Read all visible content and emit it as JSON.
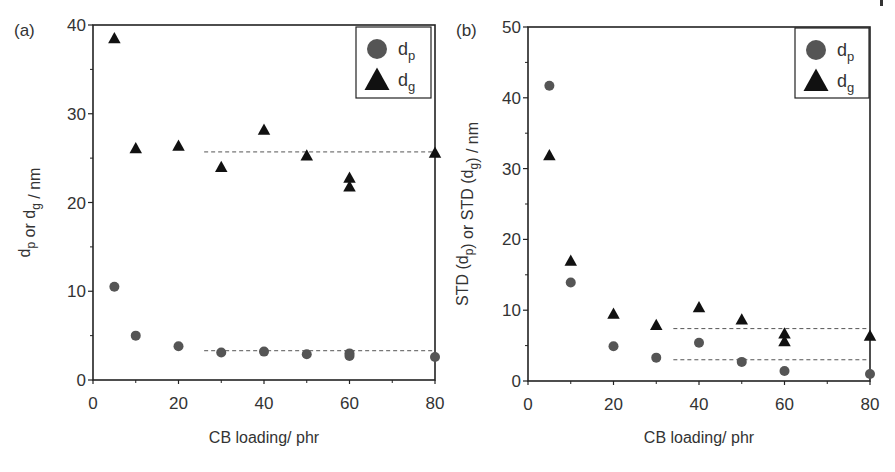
{
  "figure": {
    "corner_mark": "|"
  },
  "chart_data": [
    {
      "panel_label": "(a)",
      "type": "scatter",
      "title": "",
      "xlabel": "CB loading/ phr",
      "ylabel": "d_p or d_g / nm",
      "ylabel_parts": [
        {
          "t": "d",
          "sub": "p"
        },
        {
          "t": " or d",
          "sub": "g"
        },
        {
          "t": " / nm",
          "sub": ""
        }
      ],
      "xlim": [
        0,
        80
      ],
      "ylim": [
        0,
        40
      ],
      "xticks": [
        0,
        20,
        40,
        60,
        80
      ],
      "xminor": [
        10,
        30,
        50,
        70
      ],
      "yticks": [
        0,
        10,
        20,
        30,
        40
      ],
      "yminor": [
        5,
        15,
        25,
        35
      ],
      "grid": false,
      "legend_position": "upper right",
      "legend": [
        {
          "marker": "circle",
          "label": "d",
          "sub": "p",
          "color": "#555555"
        },
        {
          "marker": "triangle",
          "label": "d",
          "sub": "g",
          "color": "#111111"
        }
      ],
      "series": [
        {
          "name": "d_p",
          "marker": "circle",
          "color": "#555555",
          "points": [
            [
              5,
              10.5
            ],
            [
              10,
              5.0
            ],
            [
              20,
              3.8
            ],
            [
              30,
              3.1
            ],
            [
              40,
              3.2
            ],
            [
              50,
              2.9
            ],
            [
              60,
              3.0
            ],
            [
              60,
              2.7
            ],
            [
              80,
              2.6
            ]
          ]
        },
        {
          "name": "d_g",
          "marker": "triangle",
          "color": "#111111",
          "points": [
            [
              5,
              38.5
            ],
            [
              10,
              26.1
            ],
            [
              20,
              26.4
            ],
            [
              30,
              24.0
            ],
            [
              40,
              28.2
            ],
            [
              50,
              25.3
            ],
            [
              60,
              22.8
            ],
            [
              60,
              21.8
            ],
            [
              80,
              25.6
            ]
          ]
        }
      ],
      "reference_lines": [
        {
          "series": "d_g",
          "y": 25.7,
          "x_from": 26,
          "x_to": 80,
          "style": "dashed"
        },
        {
          "series": "d_p",
          "y": 3.3,
          "x_from": 26,
          "x_to": 80,
          "style": "dashed"
        }
      ]
    },
    {
      "panel_label": "(b)",
      "type": "scatter",
      "title": "",
      "xlabel": "CB loading/ phr",
      "ylabel": "STD (d_p) or STD (d_g) / nm",
      "ylabel_parts": [
        {
          "t": "STD (d",
          "sub": "p"
        },
        {
          "t": ") or STD (d",
          "sub": "g"
        },
        {
          "t": ") / nm",
          "sub": ""
        }
      ],
      "xlim": [
        0,
        80
      ],
      "ylim": [
        0,
        50
      ],
      "xticks": [
        0,
        20,
        40,
        60,
        80
      ],
      "xminor": [
        10,
        30,
        50,
        70
      ],
      "yticks": [
        0,
        10,
        20,
        30,
        40,
        50
      ],
      "yminor": [
        5,
        15,
        25,
        35,
        45
      ],
      "grid": false,
      "legend_position": "upper right",
      "legend": [
        {
          "marker": "circle",
          "label": "d",
          "sub": "p",
          "color": "#555555"
        },
        {
          "marker": "triangle",
          "label": "d",
          "sub": "g",
          "color": "#111111"
        }
      ],
      "series": [
        {
          "name": "d_p",
          "marker": "circle",
          "color": "#555555",
          "points": [
            [
              5,
              41.7
            ],
            [
              10,
              13.9
            ],
            [
              20,
              4.9
            ],
            [
              30,
              3.3
            ],
            [
              40,
              5.4
            ],
            [
              50,
              2.7
            ],
            [
              60,
              1.4
            ],
            [
              80,
              1.0
            ]
          ]
        },
        {
          "name": "d_g",
          "marker": "triangle",
          "color": "#111111",
          "points": [
            [
              5,
              31.9
            ],
            [
              10,
              17.0
            ],
            [
              20,
              9.5
            ],
            [
              30,
              7.9
            ],
            [
              40,
              10.4
            ],
            [
              50,
              8.7
            ],
            [
              60,
              6.7
            ],
            [
              60,
              5.6
            ],
            [
              80,
              6.4
            ]
          ]
        }
      ],
      "reference_lines": [
        {
          "series": "d_g",
          "y": 7.4,
          "x_from": 34,
          "x_to": 80,
          "style": "dashed"
        },
        {
          "series": "d_p",
          "y": 3.0,
          "x_from": 34,
          "x_to": 80,
          "style": "dashed"
        }
      ]
    }
  ],
  "layout": {
    "panels": [
      {
        "x0": 93,
        "x1": 435,
        "y0": 380,
        "y1": 25,
        "legend_box": [
          356,
          27,
          75,
          71
        ],
        "label_pos": [
          14,
          36
        ],
        "ylabel_x": 30
      },
      {
        "x0": 528,
        "x1": 870,
        "y0": 381,
        "y1": 27,
        "legend_box": [
          795,
          28,
          74,
          70
        ],
        "label_pos": [
          456,
          36
        ],
        "ylabel_x": 468
      }
    ]
  }
}
